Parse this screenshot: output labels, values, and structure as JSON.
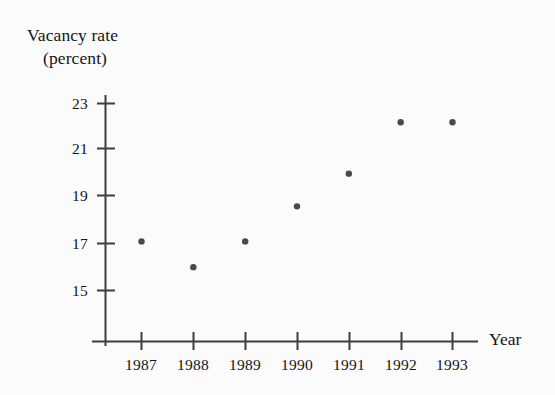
{
  "figure": {
    "background_color": "#fbfbfb",
    "ink_color": "#3d3d3d",
    "text_color": "#151515",
    "marker_color": "#4a4a4a"
  },
  "title": {
    "line1": "Vacancy rate",
    "line2": "(percent)"
  },
  "axes": {
    "x_axis_label": "Year",
    "y_axis_label": "Vacancy rate (percent)",
    "y_ticks": [
      "23",
      "21",
      "19",
      "17",
      "15"
    ],
    "x_ticks": [
      "1987",
      "1988",
      "1989",
      "1990",
      "1991",
      "1992",
      "1993"
    ]
  },
  "chart_data": {
    "type": "scatter",
    "title": "Vacancy rate (percent)",
    "xlabel": "Year",
    "ylabel": "Vacancy rate (percent)",
    "categories": [
      "1987",
      "1988",
      "1989",
      "1990",
      "1991",
      "1992",
      "1993"
    ],
    "x": [
      1987,
      1988,
      1989,
      1990,
      1991,
      1992,
      1993
    ],
    "values": [
      17.1,
      16.0,
      17.1,
      18.6,
      20.0,
      22.2,
      22.2
    ],
    "series": [
      {
        "name": "Vacancy rate",
        "values": [
          17.1,
          16.0,
          17.1,
          18.6,
          20.0,
          22.2,
          22.2
        ]
      }
    ],
    "xlim": [
      1986.5,
      1993.5
    ],
    "ylim": [
      14.0,
      23.8
    ],
    "ytick_values": [
      23,
      21,
      19,
      17,
      15
    ],
    "xtick_values": [
      1987,
      1988,
      1989,
      1990,
      1991,
      1992,
      1993
    ],
    "grid": false,
    "legend": false,
    "marker": "filled-circle",
    "marker_color": "#4a4a4a"
  }
}
